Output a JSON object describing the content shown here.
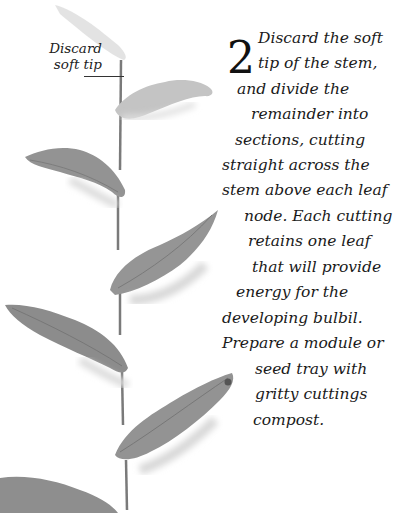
{
  "annotation": {
    "label_lines": [
      "Discard",
      "soft tip"
    ]
  },
  "step": {
    "number": "2",
    "lines": [
      {
        "text": "Discard the soft",
        "x": 53,
        "y": 0
      },
      {
        "text": "tip of the stem,",
        "x": 53,
        "y": 25
      },
      {
        "text": "and divide the",
        "x": 32,
        "y": 51
      },
      {
        "text": "remainder into",
        "x": 46,
        "y": 76
      },
      {
        "text": "sections, cutting",
        "x": 30,
        "y": 102
      },
      {
        "text": "straight across the",
        "x": 17,
        "y": 127
      },
      {
        "text": "stem above each leaf",
        "x": 17,
        "y": 152
      },
      {
        "text": "node. Each cutting",
        "x": 39,
        "y": 178
      },
      {
        "text": "retains one leaf",
        "x": 43,
        "y": 203
      },
      {
        "text": "that will provide",
        "x": 47,
        "y": 229
      },
      {
        "text": "energy for the",
        "x": 31,
        "y": 254
      },
      {
        "text": "developing bulbil.",
        "x": 17,
        "y": 280
      },
      {
        "text": "Prepare a module or",
        "x": 17,
        "y": 305
      },
      {
        "text": "seed tray with",
        "x": 50,
        "y": 331
      },
      {
        "text": "gritty cuttings",
        "x": 50,
        "y": 356
      },
      {
        "text": "compost.",
        "x": 48,
        "y": 382
      }
    ]
  },
  "colors": {
    "leaf": "#8f8f8f",
    "leaf_light": "#bdbdbd",
    "stem": "#7a7a7a",
    "text": "#1a1a1a"
  }
}
